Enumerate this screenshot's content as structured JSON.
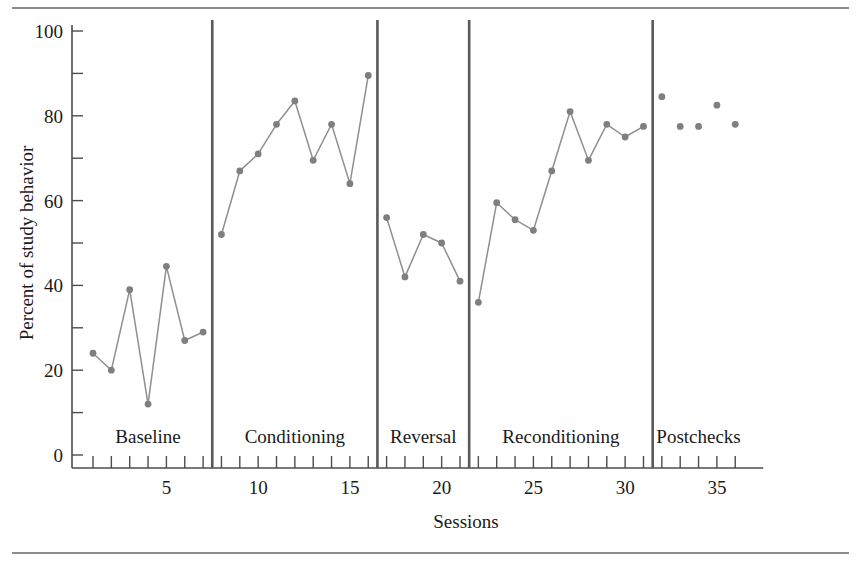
{
  "figure": {
    "rule_color": "#8c8c8c",
    "accent_color": "#7f7f7f"
  },
  "chart_data": {
    "type": "line",
    "title": "",
    "xlabel": "Sessions",
    "ylabel": "Percent of study behavior",
    "xlim": [
      0.3,
      36.7
    ],
    "ylim": [
      0,
      100
    ],
    "ytick_values": [
      0,
      10,
      20,
      30,
      40,
      50,
      60,
      70,
      80,
      90,
      100
    ],
    "ytick_labels": [
      "0",
      "",
      "20",
      "",
      "40",
      "",
      "60",
      "",
      "80",
      "",
      "100"
    ],
    "xtick_values": [
      1,
      2,
      3,
      4,
      5,
      6,
      7,
      8,
      9,
      10,
      11,
      12,
      13,
      14,
      15,
      16,
      17,
      18,
      19,
      20,
      21,
      22,
      23,
      24,
      25,
      26,
      27,
      28,
      29,
      30,
      31,
      32,
      33,
      34,
      35,
      36
    ],
    "xtick_labeled": [
      5,
      10,
      15,
      20,
      25,
      30,
      35
    ],
    "grid": false,
    "legend": null,
    "marker": "circle",
    "line_color": "#8f8f8f",
    "marker_color": "#7f7f7f",
    "phases": [
      {
        "name": "Baseline",
        "start": 1,
        "end": 7,
        "label_x": 4.0
      },
      {
        "name": "Conditioning",
        "start": 8,
        "end": 16,
        "label_x": 12.0
      },
      {
        "name": "Reversal",
        "start": 17,
        "end": 21,
        "label_x": 19.0
      },
      {
        "name": "Reconditioning",
        "start": 22,
        "end": 31,
        "label_x": 26.5
      },
      {
        "name": "Postchecks",
        "start": 32,
        "end": 36,
        "label_x": 34.0
      }
    ],
    "phase_dividers": [
      7.5,
      16.5,
      21.5,
      31.5
    ],
    "series": [
      {
        "name": "Percent of study behavior",
        "connected": true,
        "segments": [
          {
            "phase": "Baseline",
            "x": [
              1,
              2,
              3,
              4,
              5,
              6,
              7
            ],
            "values": [
              24,
              20,
              39,
              12,
              44.5,
              27,
              29
            ]
          },
          {
            "phase": "Conditioning",
            "x": [
              8,
              9,
              10,
              11,
              12,
              13,
              14,
              15,
              16
            ],
            "values": [
              52,
              67,
              71,
              78,
              83.5,
              69.5,
              78,
              64,
              89.5
            ]
          },
          {
            "phase": "Reversal",
            "x": [
              17,
              18,
              19,
              20,
              21
            ],
            "values": [
              56,
              42,
              52,
              50,
              41
            ]
          },
          {
            "phase": "Reconditioning",
            "x": [
              22,
              23,
              24,
              25,
              26,
              27,
              28,
              29,
              30,
              31
            ],
            "values": [
              36,
              59.5,
              55.5,
              53,
              67,
              81,
              69.5,
              78,
              75,
              77.5
            ]
          },
          {
            "phase": "Postchecks",
            "x": [
              32,
              33,
              34,
              35,
              36
            ],
            "values": [
              84.5,
              77.5,
              77.5,
              82.5,
              78
            ],
            "connected": false
          }
        ]
      }
    ]
  }
}
